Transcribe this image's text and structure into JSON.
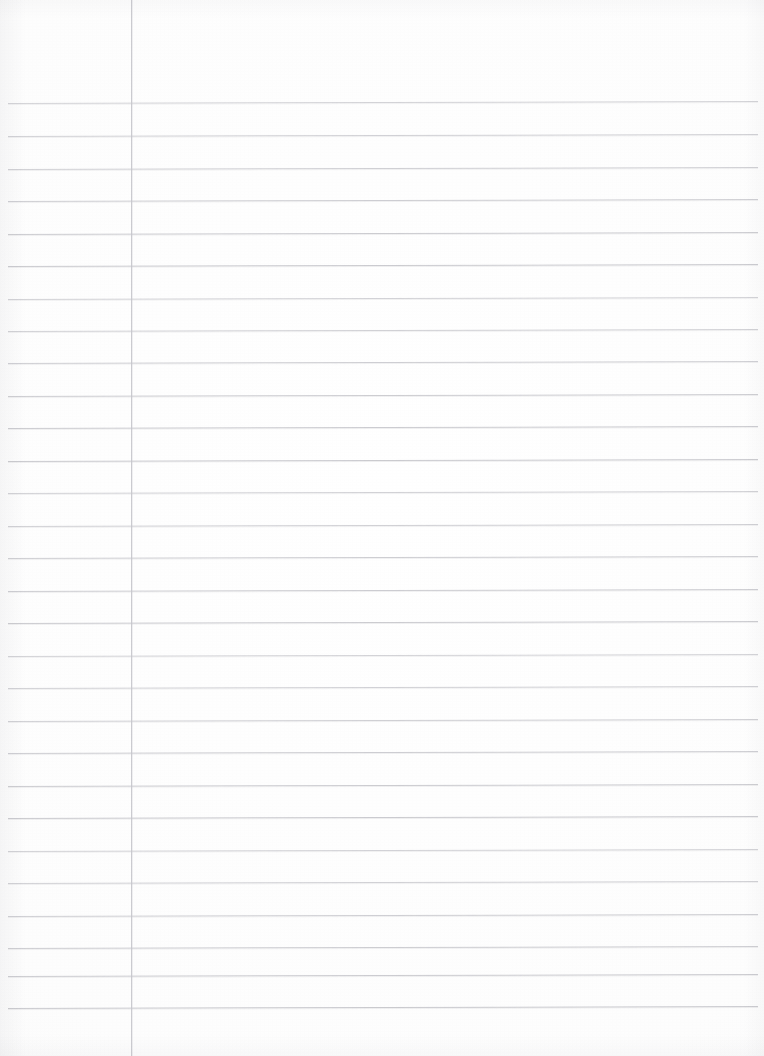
{
  "document": {
    "kind": "lined-notebook-paper-scan",
    "title": "Blank ruled paper",
    "page_width": 764,
    "page_height": 1056,
    "content_text": "",
    "is_blank": true
  },
  "paper": {
    "background_color": "#fdfdfd",
    "rule_color": "#c9c9ce",
    "margin_rule_color": "#c7c7cd",
    "skew_degrees": -0.15
  },
  "ruling": {
    "horizontal_line_count": 29,
    "line_spacing_px": 32.5,
    "first_line_y": 103,
    "last_line_y": 1008,
    "line_start_x": 8,
    "line_end_x": 758,
    "horizontal_lines_y": [
      103,
      136,
      169,
      201,
      234,
      266,
      299,
      331,
      363,
      396,
      428,
      461,
      493,
      526,
      558,
      591,
      623,
      656,
      688,
      721,
      753,
      786,
      818,
      851,
      883,
      916,
      948,
      976,
      1008
    ],
    "vertical_margin_x": 131,
    "vertical_margin_top": 0,
    "vertical_margin_bottom": 1056
  },
  "regions": {
    "header_label": "",
    "margin_label": "",
    "body_label": ""
  }
}
